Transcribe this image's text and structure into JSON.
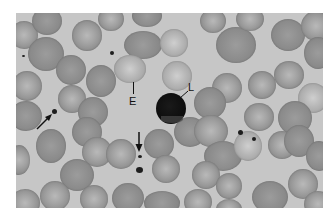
{
  "figure": {
    "type": "micrograph",
    "labels": {
      "erythrocyte": "E",
      "lymphocyte": "L"
    },
    "arrows": [
      {
        "target": "platelet",
        "direction": "up-right"
      },
      {
        "target": "platelet",
        "direction": "down"
      }
    ],
    "colors": {
      "background": "#c6c6c6",
      "cell": "#8e8e8e",
      "nucleus": "#0c0c0c",
      "annotation": "#111111"
    }
  }
}
